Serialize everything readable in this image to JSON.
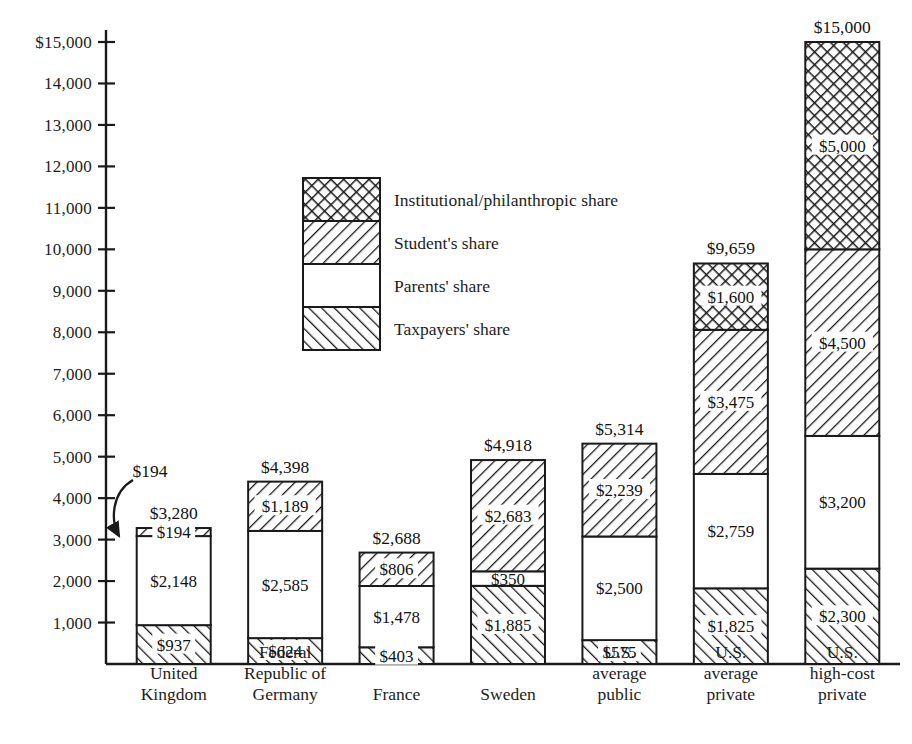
{
  "chart_data": {
    "type": "bar",
    "subtype": "stacked-bar",
    "title": "",
    "xlabel": "",
    "ylabel": "",
    "ylim": [
      0,
      15000
    ],
    "ytick_step": 1000,
    "ytick_labels": [
      "$15,000",
      "14,000",
      "13,000",
      "12,000",
      "11,000",
      "10,000",
      "9,000",
      "8,000",
      "7,000",
      "6,000",
      "5,000",
      "4,000",
      "3,000",
      "2,000",
      "1,000"
    ],
    "ytick_values": [
      15000,
      14000,
      13000,
      12000,
      11000,
      10000,
      9000,
      8000,
      7000,
      6000,
      5000,
      4000,
      3000,
      2000,
      1000
    ],
    "grid": false,
    "legend_position": "inside-upper-left",
    "categories": [
      "United Kingdom",
      "Federal Republic of Germany",
      "France",
      "Sweden",
      "U.S. average public",
      "U.S. average private",
      "U.S. high-cost private"
    ],
    "category_lines": [
      [
        "United",
        "Kingdom"
      ],
      [
        "Federal",
        "Republic of",
        "Germany"
      ],
      [
        "France"
      ],
      [
        "Sweden"
      ],
      [
        "U.S.",
        "average",
        "public"
      ],
      [
        "U.S.",
        "average",
        "private"
      ],
      [
        "U.S.",
        "high-cost",
        "private"
      ]
    ],
    "series": [
      {
        "name": "Taxpayers' share",
        "pattern": "hatch-forward",
        "values": [
          937,
          624,
          403,
          1885,
          575,
          1825,
          2300
        ]
      },
      {
        "name": "Parents' share",
        "pattern": "solid-white",
        "values": [
          2148,
          2585,
          1478,
          350,
          2500,
          2759,
          3200
        ]
      },
      {
        "name": "Student's share",
        "pattern": "hatch-backward",
        "values": [
          194,
          1189,
          806,
          2683,
          2239,
          3475,
          4500
        ]
      },
      {
        "name": "Institutional/philanthropic share",
        "pattern": "crosshatch",
        "values": [
          0,
          0,
          0,
          0,
          0,
          1600,
          5000
        ]
      }
    ],
    "segment_labels": [
      [
        "$937",
        "$2,148",
        "$194",
        ""
      ],
      [
        "$624",
        "$2,585",
        "$1,189",
        ""
      ],
      [
        "$403",
        "$1,478",
        "$806",
        ""
      ],
      [
        "$1,885",
        "$350",
        "$2,683",
        ""
      ],
      [
        "$575",
        "$2,500",
        "$2,239",
        ""
      ],
      [
        "$1,825",
        "$2,759",
        "$3,475",
        "$1,600"
      ],
      [
        "$2,300",
        "$3,200",
        "$4,500",
        "$5,000"
      ]
    ],
    "totals": [
      3280,
      4398,
      2688,
      4918,
      5314,
      9659,
      15000
    ],
    "total_labels": [
      "$3,280",
      "$4,398",
      "$2,688",
      "$4,918",
      "$5,314",
      "$9,659",
      "$15,000"
    ],
    "annotations": [
      {
        "text": "$194",
        "target_category": "United Kingdom",
        "target_series": "Student's share",
        "style": "curved-arrow"
      }
    ]
  },
  "legend": {
    "items": [
      {
        "label": "Institutional/philanthropic share",
        "pattern": "crosshatch"
      },
      {
        "label": "Student's share",
        "pattern": "hatch-backward"
      },
      {
        "label": "Parents' share",
        "pattern": "solid-white"
      },
      {
        "label": "Taxpayers' share",
        "pattern": "hatch-forward"
      }
    ]
  },
  "colors": {
    "ink": "#1a1a1a",
    "background": "#ffffff"
  }
}
